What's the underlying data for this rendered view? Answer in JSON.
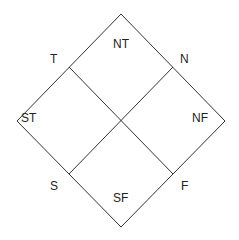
{
  "diagram": {
    "type": "diamond-quadrant",
    "line_color": "#333333",
    "corner_labels": {
      "top_left_edge": "T",
      "top_right_edge": "N",
      "bottom_left_edge": "S",
      "bottom_right_edge": "F"
    },
    "quadrant_labels": {
      "top": "NT",
      "left": "ST",
      "right": "NF",
      "bottom": "SF"
    }
  }
}
